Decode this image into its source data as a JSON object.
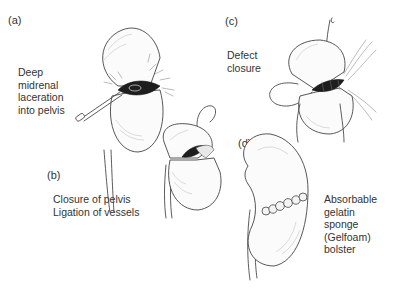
{
  "figure": {
    "panels": [
      {
        "letter": "(a)",
        "caption": "Deep\nmidrenal\nlaceration\ninto pelvis"
      },
      {
        "letter": "(b)",
        "caption": "Closure of pelvis\nLigation of vessels"
      },
      {
        "letter": "(c)",
        "caption": "Defect\nclosure"
      },
      {
        "letter": "(d)",
        "caption": "Absorbable\ngelatin\nsponge\n(Gelfoam)\nbolster"
      }
    ],
    "colors": {
      "ink": "#4a4a4a",
      "background": "#ffffff",
      "wound": "#1e1e1e"
    }
  }
}
